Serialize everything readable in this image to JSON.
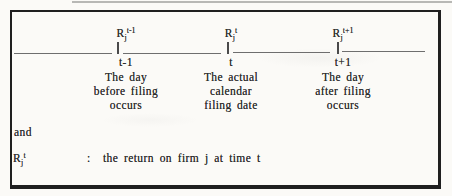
{
  "figure": {
    "points": [
      {
        "symbol": {
          "base": "R",
          "sub": "j",
          "sup": "t-1"
        },
        "time": "t-1",
        "desc": [
          "The day",
          "before filing",
          "occurs"
        ]
      },
      {
        "symbol": {
          "base": "R",
          "sub": "j",
          "sup": "t"
        },
        "time": "t",
        "desc": [
          "The actual",
          "calendar",
          "filing date"
        ]
      },
      {
        "symbol": {
          "base": "R",
          "sub": "j",
          "sup": "t+1"
        },
        "time": "t+1",
        "desc": [
          "The day",
          "after filing",
          "occurs"
        ]
      }
    ],
    "connector_word": "and",
    "definition": {
      "symbol": {
        "base": "R",
        "sub": "j",
        "sup": "t"
      },
      "colon": ":",
      "text": "the return on firm j at time t"
    },
    "colors": {
      "frame_border": "#1f1f1f",
      "timeline": "#6e6e6e",
      "text": "#2c2c2c",
      "paper": "#fbfaf7"
    }
  }
}
